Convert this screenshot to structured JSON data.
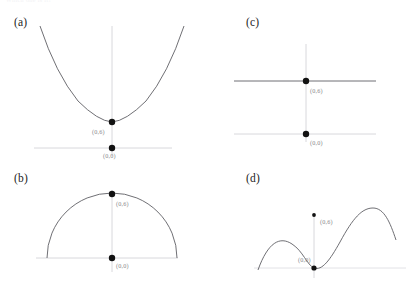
{
  "figure": {
    "faint_header_text": "Which one is it?",
    "background_color": "#ffffff",
    "curve_color": "#5f5f64",
    "axis_color": "#d0d0d4",
    "point_color": "#121212",
    "label_color": "#8a8a8e"
  },
  "panels": [
    {
      "id": "a",
      "label": "(a)",
      "curve_type": "parabola",
      "description": "upward-opening parabola with vertex on the y-axis",
      "points": [
        {
          "name": "vertex",
          "label": "(0,6)",
          "x": 0,
          "y": 6
        },
        {
          "name": "origin",
          "label": "(0,0)",
          "x": 0,
          "y": 0
        }
      ]
    },
    {
      "id": "b",
      "label": "(b)",
      "curve_type": "semicircle",
      "description": "upper half of a circle centered at the origin",
      "points": [
        {
          "name": "apex",
          "label": "(0,6)",
          "x": 0,
          "y": 6
        },
        {
          "name": "origin",
          "label": "(0,0)",
          "x": 0,
          "y": 0
        }
      ]
    },
    {
      "id": "c",
      "label": "(c)",
      "curve_type": "horizontal-line",
      "description": "constant horizontal line above the x-axis",
      "points": [
        {
          "name": "line-point",
          "label": "(0,6)",
          "x": 0,
          "y": 6
        },
        {
          "name": "origin",
          "label": "(0,0)",
          "x": 0,
          "y": 0
        }
      ]
    },
    {
      "id": "d",
      "label": "(d)",
      "curve_type": "sinusoid",
      "description": "wavy sinusoidal curve touching the x-axis at the origin",
      "points": [
        {
          "name": "upper-point",
          "label": "(0,6)",
          "x": 0,
          "y": 6
        },
        {
          "name": "origin",
          "label": "(0,0)",
          "x": 0,
          "y": 0
        }
      ]
    }
  ]
}
